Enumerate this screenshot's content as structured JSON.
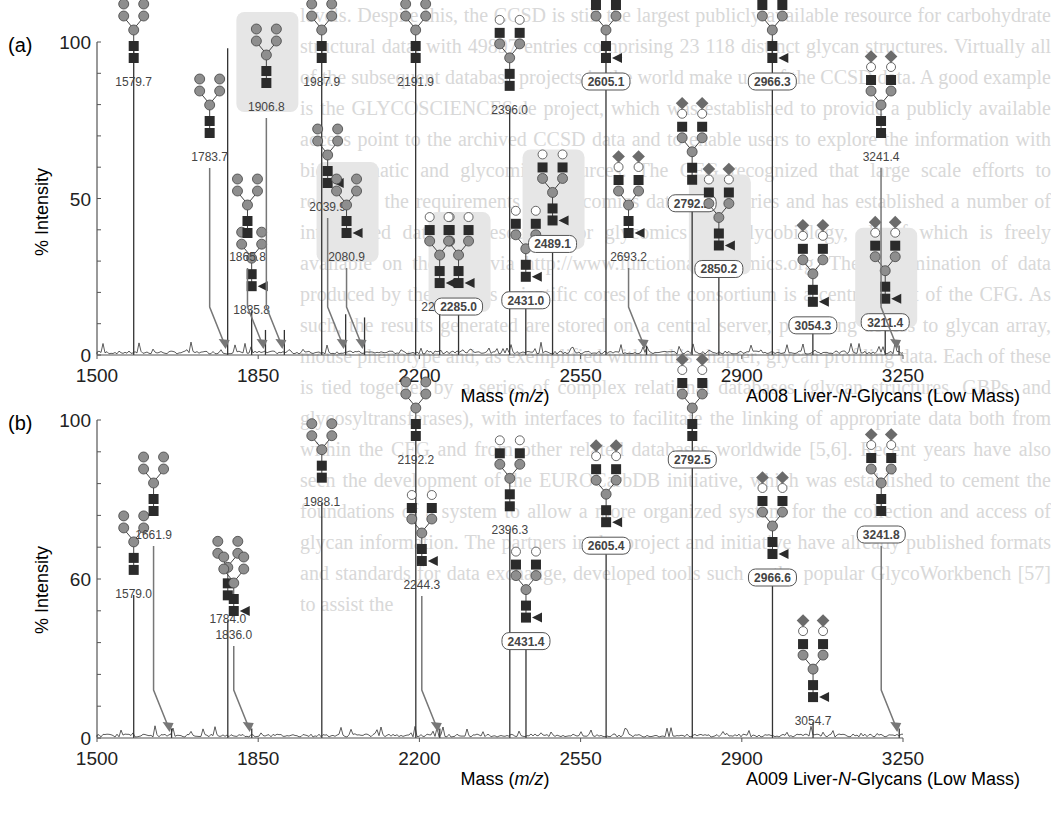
{
  "background_text": "levels. Despite this, the CCSD is still the largest publicly available resource for carbohydrate structural data, with 49897 entries comprising 23 118 distinct glycan structures. Virtually all of the subsequent database projects in the world make use of the CCSD data. A good example is the GLYCOSCIENCES.de project, which was established to provide a publicly available access point to the archived CCSD data and to enable users to explore the information with bioinformatic and glycomic resources. The CFG recognized that large scale efforts to recognize the requirements for glycomics data repositories and has established a number of interrelated database resources for glycomics and glycobiology, all of which is freely available on the web via http://www.functionalglycomics.org. The dissemination of data produced by the various scientific cores of the consortium is a central tenet of the CFG. As such, the results generated are stored on a central server, providing access to glycan array, mouse phenotype and, as exemplified within this chapter, glycan profiling data. Each of these is tied together by a series of complex relational databases (glycan structures, GBPs, and glycosyltransferases), with interfaces to facilitate the linking of appropriate data both from within the CFG and from other related databases worldwide [5,6]. Recent years have also seen the development of the EUROCarbDB initiative, which was established to cement the foundations of a system to allow a more organized system for the collection and access of glycan information. The partners in the project and initiative have already published formats and standards for data exchange, developed tools such as the popular GlycoWorkbench [57] to assist the",
  "chart_data": [
    {
      "type": "bar",
      "panel_label": "(a)",
      "title": "A008 Liver-N-Glycans (Low Mass)",
      "title_prefix": "A008 Liver-",
      "title_italic": "N",
      "title_suffix": "-Glycans (Low Mass)",
      "xlabel": "Mass (m/z)",
      "xlabel_prefix": "Mass (",
      "xlabel_italic": "m/z",
      "xlabel_suffix": ")",
      "ylabel": "% Intensity",
      "xlim": [
        1500,
        3250
      ],
      "ylim": [
        0,
        100
      ],
      "xticks": [
        1500,
        1850,
        2200,
        2550,
        2900,
        3250
      ],
      "yticks": [
        0,
        50,
        100
      ],
      "ytick_labels": [
        "0",
        "50",
        "100"
      ],
      "grid": false,
      "peaks": [
        {
          "mz": 1579.7,
          "intensity": 98,
          "label": "1579.7",
          "boxed": false,
          "arrow": false
        },
        {
          "mz": 1783.7,
          "intensity": 98,
          "label": "1783.7",
          "boxed": false,
          "arrow": true
        },
        {
          "mz": 1835.8,
          "intensity": 14,
          "label": "1835.8",
          "boxed": false,
          "arrow": false
        },
        {
          "mz": 1865.8,
          "intensity": 8,
          "label": "1865.8",
          "boxed": false,
          "arrow": true
        },
        {
          "mz": 1906.8,
          "intensity": 8,
          "label": "1906.8",
          "boxed": false,
          "arrow": true,
          "highlight": true
        },
        {
          "mz": 1987.9,
          "intensity": 100,
          "label": "1987.9",
          "boxed": false,
          "arrow": false
        },
        {
          "mz": 2039.9,
          "intensity": 13,
          "label": "2039.9",
          "boxed": false,
          "arrow": true
        },
        {
          "mz": 2080.9,
          "intensity": 12,
          "label": "2080.9",
          "boxed": false,
          "arrow": true,
          "highlight": true
        },
        {
          "mz": 2191.9,
          "intensity": 98,
          "label": "2191.9",
          "boxed": false,
          "arrow": false
        },
        {
          "mz": 2244.0,
          "intensity": 15,
          "label": "2244.0",
          "boxed": false,
          "arrow": false
        },
        {
          "mz": 2285.0,
          "intensity": 15,
          "label": "2285.0",
          "boxed": true,
          "arrow": false,
          "highlight": true
        },
        {
          "mz": 2396.0,
          "intensity": 78,
          "label": "2396.0",
          "boxed": false,
          "arrow": false
        },
        {
          "mz": 2431.0,
          "intensity": 17,
          "label": "2431.0",
          "boxed": true,
          "arrow": false
        },
        {
          "mz": 2489.1,
          "intensity": 35,
          "label": "2489.1",
          "boxed": true,
          "arrow": false,
          "highlight": true
        },
        {
          "mz": 2605.1,
          "intensity": 100,
          "label": "2605.1",
          "boxed": true,
          "arrow": false
        },
        {
          "mz": 2693.2,
          "intensity": 3,
          "label": "2693.2",
          "boxed": false,
          "arrow": true
        },
        {
          "mz": 2792.2,
          "intensity": 48,
          "label": "2792.2",
          "boxed": true,
          "arrow": false
        },
        {
          "mz": 2850.2,
          "intensity": 27,
          "label": "2850.2",
          "boxed": true,
          "arrow": false,
          "highlight": true
        },
        {
          "mz": 2966.3,
          "intensity": 100,
          "label": "2966.3",
          "boxed": true,
          "arrow": false
        },
        {
          "mz": 3054.3,
          "intensity": 9,
          "label": "3054.3",
          "boxed": true,
          "arrow": false
        },
        {
          "mz": 3211.4,
          "intensity": 10,
          "label": "3211.4",
          "boxed": true,
          "arrow": false,
          "highlight": true
        },
        {
          "mz": 3241.4,
          "intensity": 3,
          "label": "3241.4",
          "boxed": false,
          "arrow": true
        }
      ]
    },
    {
      "type": "bar",
      "panel_label": "(b)",
      "title": "A009 Liver-N-Glycans (Low Mass)",
      "title_prefix": "A009 Liver-",
      "title_italic": "N",
      "title_suffix": "-Glycans (Low Mass)",
      "xlabel": "Mass (m/z)",
      "xlabel_prefix": "Mass (",
      "xlabel_italic": "m/z",
      "xlabel_suffix": ")",
      "ylabel": "% Intensity",
      "xlim": [
        1500,
        3250
      ],
      "ylim": [
        0,
        100
      ],
      "xticks": [
        1500,
        1850,
        2200,
        2550,
        2900,
        3250
      ],
      "yticks": [
        0,
        50,
        100
      ],
      "ytick_labels": [
        "0",
        "60",
        "100"
      ],
      "grid": false,
      "peaks": [
        {
          "mz": 1579.7,
          "intensity": 45,
          "label": "1579.0",
          "boxed": false,
          "arrow": false
        },
        {
          "mz": 1661.9,
          "intensity": 3,
          "label": "1661.9",
          "boxed": false,
          "arrow": true
        },
        {
          "mz": 1784.0,
          "intensity": 37,
          "label": "1784.0",
          "boxed": false,
          "arrow": false
        },
        {
          "mz": 1836.0,
          "intensity": 3,
          "label": "1836.0",
          "boxed": false,
          "arrow": true
        },
        {
          "mz": 1988.1,
          "intensity": 74,
          "label": "1988.1",
          "boxed": false,
          "arrow": false
        },
        {
          "mz": 2192.2,
          "intensity": 100,
          "label": "2192.2",
          "boxed": false,
          "arrow": false
        },
        {
          "mz": 2244.3,
          "intensity": 3,
          "label": "2244.3",
          "boxed": false,
          "arrow": true
        },
        {
          "mz": 2396.3,
          "intensity": 65,
          "label": "2396.3",
          "boxed": false,
          "arrow": false
        },
        {
          "mz": 2431.4,
          "intensity": 30,
          "label": "2431.4",
          "boxed": true,
          "arrow": false
        },
        {
          "mz": 2605.4,
          "intensity": 60,
          "label": "2605.4",
          "boxed": true,
          "arrow": false
        },
        {
          "mz": 2792.5,
          "intensity": 100,
          "label": "2792.5",
          "boxed": true,
          "arrow": false
        },
        {
          "mz": 2966.6,
          "intensity": 50,
          "label": "2966.6",
          "boxed": true,
          "arrow": false
        },
        {
          "mz": 3054.7,
          "intensity": 5,
          "label": "3054.7",
          "boxed": false,
          "arrow": false
        },
        {
          "mz": 3241.8,
          "intensity": 3,
          "label": "3241.8",
          "boxed": true,
          "arrow": true
        }
      ]
    }
  ],
  "colors": {
    "axis": "#555555",
    "spectrum": "#333333",
    "glcnac_square": "#2b2b2b",
    "mannose_circle": "#8e8e8e",
    "galactose_circle": "#ffffff",
    "neuac_diamond": "#6b6b6b",
    "fucose_triangle": "#2b2b2b",
    "highlight_bg": "#e6e6e6",
    "arrow": "#777777"
  }
}
